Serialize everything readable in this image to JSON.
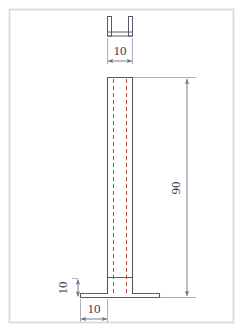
{
  "drawing": {
    "title": "U-channel post elevation drawing",
    "views": [
      {
        "name": "top-plan-view",
        "shape": "u-channel-section",
        "label": "U channel top view"
      },
      {
        "name": "front-elevation-view",
        "shape": "post-with-base-flange",
        "label": "Post front elevation"
      }
    ],
    "dimensions": [
      {
        "name": "channel-width",
        "value": "10",
        "orientation": "horizontal",
        "units": "mm",
        "location": "top"
      },
      {
        "name": "post-height",
        "value": "90",
        "orientation": "vertical",
        "units": "mm",
        "location": "right"
      },
      {
        "name": "base-thickness",
        "value": "10",
        "orientation": "vertical",
        "units": "mm",
        "location": "lower-left"
      },
      {
        "name": "base-offset-width",
        "value": "10",
        "orientation": "horizontal",
        "units": "mm",
        "location": "bottom"
      }
    ],
    "colors": {
      "outline": "#5a5a6e",
      "centerline": "#b3493c",
      "dimension": "#6e6e82",
      "text": "#3b3b52",
      "frame": "#d8d8d8",
      "background": "#ffffff"
    },
    "centerlines": {
      "style": "dashed",
      "count": 2,
      "description": "hidden edge centerlines of channel walls"
    }
  }
}
